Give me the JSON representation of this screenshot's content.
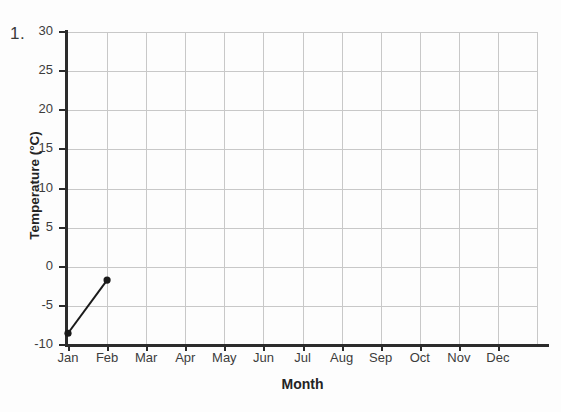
{
  "question_number": "1.",
  "chart_data": {
    "type": "line",
    "title": "",
    "xlabel": "Month",
    "ylabel": "Temperature (°C)",
    "categories": [
      "Jan",
      "Feb",
      "Mar",
      "Apr",
      "May",
      "Jun",
      "Jul",
      "Aug",
      "Sep",
      "Oct",
      "Nov",
      "Dec"
    ],
    "series": [
      {
        "name": "Temperature",
        "values": [
          -8.5,
          -1.7,
          null,
          null,
          null,
          null,
          null,
          null,
          null,
          null,
          null,
          null
        ],
        "marker": "filled-circle",
        "color": "#1a1a1a"
      }
    ],
    "ylim": [
      -10,
      30
    ],
    "yticks": [
      30,
      25,
      20,
      15,
      10,
      5,
      0,
      -5,
      -10
    ],
    "ytick_labels": [
      "30",
      "25",
      "20",
      "15",
      "10",
      "5",
      "0",
      "-5",
      "-10"
    ],
    "grid": true,
    "legend": "none"
  },
  "colors": {
    "gridline": "#c8c8c8",
    "axis": "#2b2b2b",
    "series": "#1a1a1a",
    "background": "#fdfdfd",
    "tick_text": "#3c3c3c",
    "title_text": "#242424"
  }
}
